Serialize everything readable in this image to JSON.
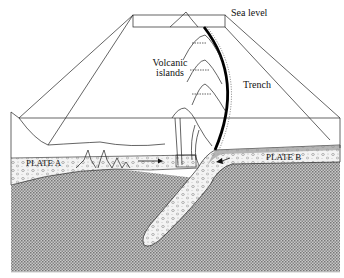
{
  "diagram": {
    "type": "cross-section",
    "labels": {
      "sea_level": "Sea level",
      "volcanic_islands_line1": "Volcanic",
      "volcanic_islands_line2": "islands",
      "trench": "Trench",
      "plate_a": "PLATE A",
      "plate_b": "PLATE B"
    },
    "colors": {
      "background": "#ffffff",
      "line": "#111111",
      "mantle_fill": "#9a9a9a",
      "crust_fill": "#eeeeee",
      "trench_line": "#000000"
    },
    "arrows": [
      {
        "label": "plate-a-motion",
        "direction": "right"
      },
      {
        "label": "plate-b-motion",
        "direction": "left"
      }
    ]
  }
}
